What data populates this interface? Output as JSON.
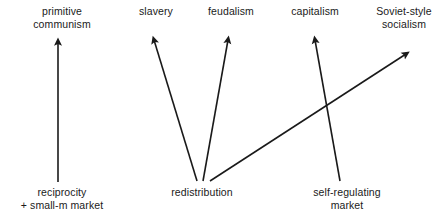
{
  "diagram": {
    "background_color": "#ffffff",
    "line_color": "#1a1a1a",
    "width": 442,
    "height": 222,
    "top_nodes": [
      {
        "id": "primitive-communism",
        "lines": [
          "primitive",
          "communism"
        ],
        "center_x": 62,
        "top_y": 5
      },
      {
        "id": "slavery",
        "lines": [
          "slavery"
        ],
        "center_x": 156,
        "top_y": 5
      },
      {
        "id": "feudalism",
        "lines": [
          "feudalism"
        ],
        "center_x": 231,
        "top_y": 5
      },
      {
        "id": "capitalism",
        "lines": [
          "capitalism"
        ],
        "center_x": 315,
        "top_y": 5
      },
      {
        "id": "soviet-style-socialism",
        "lines": [
          "Soviet-style",
          "socialism"
        ],
        "center_x": 404,
        "top_y": 5
      }
    ],
    "bottom_nodes": [
      {
        "id": "reciprocity-small-m-market",
        "lines": [
          "reciprocity",
          "+ small-m market"
        ],
        "center_x": 62,
        "top_y": 186
      },
      {
        "id": "redistribution",
        "lines": [
          "redistribution"
        ],
        "center_x": 202,
        "top_y": 186
      },
      {
        "id": "self-regulating-market",
        "lines": [
          "self-regulating",
          "market"
        ],
        "center_x": 347,
        "top_y": 186
      }
    ],
    "arrows": [
      {
        "id": "reciprocity-to-primitive-communism",
        "from": "reciprocity-small-m-market",
        "to": "primitive-communism",
        "x1": 58,
        "y1": 182,
        "x2": 58,
        "y2": 42
      },
      {
        "id": "redistribution-to-slavery",
        "from": "redistribution",
        "to": "slavery",
        "x1": 197,
        "y1": 181,
        "x2": 154,
        "y2": 40
      },
      {
        "id": "redistribution-to-feudalism",
        "from": "redistribution",
        "to": "feudalism",
        "x1": 203,
        "y1": 181,
        "x2": 228,
        "y2": 40
      },
      {
        "id": "redistribution-to-soviet-style-socialism",
        "from": "redistribution",
        "to": "soviet-style-socialism",
        "x1": 210,
        "y1": 181,
        "x2": 406,
        "y2": 54
      },
      {
        "id": "self-regulating-market-to-capitalism",
        "from": "self-regulating-market",
        "to": "capitalism",
        "x1": 340,
        "y1": 181,
        "x2": 315,
        "y2": 40
      }
    ]
  }
}
